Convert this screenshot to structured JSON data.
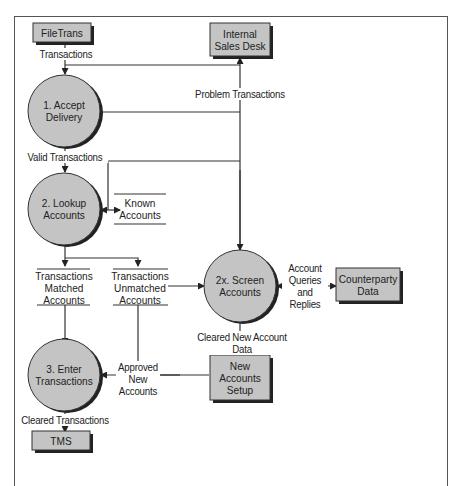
{
  "diagram": {
    "type": "data-flow-diagram",
    "colors": {
      "process_fill": "#c4c4c4",
      "entity_fill": "#c4c4c4",
      "shadow": "#222222",
      "line": "#333333"
    },
    "external_entities": [
      {
        "id": "filetrans",
        "label": "FileTrans"
      },
      {
        "id": "sales_desk",
        "label": "Internal Sales Desk",
        "lines": [
          "Internal",
          "Sales Desk"
        ]
      },
      {
        "id": "counterparty",
        "label": "Counterparty Data",
        "lines": [
          "Counterparty",
          "Data"
        ]
      },
      {
        "id": "new_accounts",
        "label": "New Accounts Setup",
        "lines": [
          "New",
          "Accounts",
          "Setup"
        ]
      },
      {
        "id": "tms",
        "label": "TMS"
      }
    ],
    "processes": [
      {
        "id": "p1",
        "label": "1. Accept Delivery",
        "lines": [
          "1. Accept",
          "Delivery"
        ]
      },
      {
        "id": "p2",
        "label": "2. Lookup Accounts",
        "lines": [
          "2. Lookup",
          "Accounts"
        ]
      },
      {
        "id": "p2x",
        "label": "2x. Screen Accounts",
        "lines": [
          "2x. Screen",
          "Accounts"
        ]
      },
      {
        "id": "p3",
        "label": "3. Enter Transactions",
        "lines": [
          "3. Enter",
          "Transactions"
        ]
      }
    ],
    "data_stores": [
      {
        "id": "known",
        "label": "Known Accounts",
        "lines": [
          "Known",
          "Accounts"
        ]
      },
      {
        "id": "matched",
        "label": "Transactions Matched Accounts",
        "lines": [
          "Transactions",
          "Matched",
          "Accounts"
        ]
      },
      {
        "id": "unmatched",
        "label": "Transactions Unmatched Accounts",
        "lines": [
          "Transactions",
          "Unmatched",
          "Accounts"
        ]
      }
    ],
    "flows": [
      {
        "from": "filetrans",
        "to": "p1",
        "label": "Transactions"
      },
      {
        "from": "p1",
        "to": "sales_desk",
        "label": "Problem Transactions"
      },
      {
        "from": "p1",
        "to": "p2",
        "label": "Valid Transactions"
      },
      {
        "from": "p2",
        "to": "known",
        "label": ""
      },
      {
        "from": "p2",
        "to": "matched",
        "label": ""
      },
      {
        "from": "p2",
        "to": "unmatched",
        "label": ""
      },
      {
        "from": "unmatched",
        "to": "p2x",
        "label": ""
      },
      {
        "from": "p2x",
        "to": "counterparty",
        "label": "Account Queries and Replies",
        "lines": [
          "Account",
          "Queries",
          "and",
          "Replies"
        ]
      },
      {
        "from": "p2x",
        "to": "new_accounts",
        "label": "Cleared New Account Data"
      },
      {
        "from": "new_accounts",
        "to": "p3",
        "label": "Approved New Accounts",
        "lines": [
          "Approved",
          "New",
          "Accounts"
        ]
      },
      {
        "from": "matched",
        "to": "p3",
        "label": ""
      },
      {
        "from": "p3",
        "to": "tms",
        "label": "Cleared Transactions"
      }
    ]
  }
}
